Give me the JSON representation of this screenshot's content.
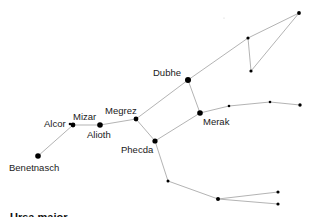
{
  "diagram": {
    "line_color": "#aaaaaa",
    "star_color": "#000000",
    "stars": [
      {
        "id": "benetnasch",
        "name": "Benetnasch",
        "x": 38,
        "y": 156,
        "r": 2.8
      },
      {
        "id": "alcor",
        "name": "Alcor",
        "x": 70,
        "y": 124,
        "r": 1.3
      },
      {
        "id": "mizar",
        "name": "Mizar",
        "x": 73,
        "y": 125,
        "r": 2.4
      },
      {
        "id": "alioth",
        "name": "Alioth",
        "x": 100,
        "y": 125,
        "r": 2.8
      },
      {
        "id": "megrez",
        "name": "Megrez",
        "x": 136,
        "y": 119,
        "r": 2.4
      },
      {
        "id": "phecda",
        "name": "Phecda",
        "x": 155,
        "y": 141,
        "r": 2.6
      },
      {
        "id": "dubhe",
        "name": "Dubhe",
        "x": 188,
        "y": 80,
        "r": 3.0
      },
      {
        "id": "merak",
        "name": "Merak",
        "x": 200,
        "y": 113,
        "r": 2.8
      },
      {
        "id": "s1",
        "name": "",
        "x": 248,
        "y": 38,
        "r": 1.6
      },
      {
        "id": "s2",
        "name": "",
        "x": 251,
        "y": 71,
        "r": 1.6
      },
      {
        "id": "s3",
        "name": "",
        "x": 299,
        "y": 13,
        "r": 1.9
      },
      {
        "id": "s4",
        "name": "",
        "x": 229,
        "y": 106,
        "r": 1.3
      },
      {
        "id": "s5",
        "name": "",
        "x": 270,
        "y": 102,
        "r": 1.3
      },
      {
        "id": "s6",
        "name": "",
        "x": 300,
        "y": 105,
        "r": 1.7
      },
      {
        "id": "s7",
        "name": "",
        "x": 168,
        "y": 181,
        "r": 1.5
      },
      {
        "id": "s8",
        "name": "",
        "x": 218,
        "y": 199,
        "r": 2.0
      },
      {
        "id": "s9",
        "name": "",
        "x": 278,
        "y": 192,
        "r": 1.6
      },
      {
        "id": "s10",
        "name": "",
        "x": 278,
        "y": 204,
        "r": 1.6
      },
      {
        "id": "faint",
        "name": "",
        "x": 224,
        "y": 18,
        "r": 0.6
      }
    ],
    "edges": [
      [
        "benetnasch",
        "mizar"
      ],
      [
        "mizar",
        "alioth"
      ],
      [
        "alioth",
        "megrez"
      ],
      [
        "megrez",
        "phecda"
      ],
      [
        "megrez",
        "dubhe"
      ],
      [
        "dubhe",
        "merak"
      ],
      [
        "merak",
        "phecda"
      ],
      [
        "dubhe",
        "s1"
      ],
      [
        "s1",
        "s3"
      ],
      [
        "s1",
        "s2"
      ],
      [
        "s2",
        "s3"
      ],
      [
        "merak",
        "s4"
      ],
      [
        "s4",
        "s5"
      ],
      [
        "s5",
        "s6"
      ],
      [
        "phecda",
        "s7"
      ],
      [
        "s7",
        "s8"
      ],
      [
        "s8",
        "s9"
      ],
      [
        "s8",
        "s10"
      ]
    ],
    "labels": [
      {
        "text": "Dubhe",
        "x": 153,
        "y": 68
      },
      {
        "text": "Megrez",
        "x": 105,
        "y": 106
      },
      {
        "text": "Mizar",
        "x": 73,
        "y": 112
      },
      {
        "text": "Alcor",
        "x": 44,
        "y": 119
      },
      {
        "text": "Alioth",
        "x": 87,
        "y": 130
      },
      {
        "text": "Merak",
        "x": 203,
        "y": 117
      },
      {
        "text": "Phecda",
        "x": 121,
        "y": 145
      },
      {
        "text": "Benetnasch",
        "x": 9,
        "y": 163
      }
    ],
    "footer_text": "Ursa major"
  }
}
